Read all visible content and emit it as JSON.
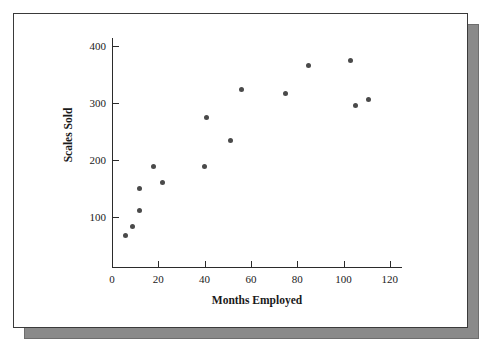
{
  "figure": {
    "background_color": "#ffffff",
    "frame_border_color": "#3a3a3a",
    "shadow_color": "#8a8a8a",
    "point_color": "#4a4a4a",
    "axis_color": "#2b2b2b"
  },
  "chart_data": {
    "type": "scatter",
    "title": "",
    "xlabel": "Months Employed",
    "ylabel": "Scales Sold",
    "xlim": [
      0,
      128
    ],
    "ylim": [
      0,
      420
    ],
    "xticks": [
      0,
      20,
      40,
      60,
      80,
      100,
      120
    ],
    "xtick_labels": [
      "0",
      "20",
      "40",
      "60",
      "80",
      "100",
      "120"
    ],
    "yticks": [
      100,
      200,
      300,
      400
    ],
    "ytick_labels": [
      "100",
      "200",
      "300",
      "400"
    ],
    "grid": false,
    "legend": null,
    "marker": "filled-circle",
    "series": [
      {
        "name": "Salespeople",
        "points": [
          {
            "x": 6,
            "y": 67
          },
          {
            "x": 9,
            "y": 83
          },
          {
            "x": 12,
            "y": 111
          },
          {
            "x": 12,
            "y": 150
          },
          {
            "x": 18,
            "y": 189
          },
          {
            "x": 22,
            "y": 160
          },
          {
            "x": 40,
            "y": 189
          },
          {
            "x": 41,
            "y": 275
          },
          {
            "x": 51,
            "y": 234
          },
          {
            "x": 56,
            "y": 324
          },
          {
            "x": 75,
            "y": 316
          },
          {
            "x": 85,
            "y": 366
          },
          {
            "x": 103,
            "y": 374
          },
          {
            "x": 105,
            "y": 295
          },
          {
            "x": 111,
            "y": 307
          }
        ]
      }
    ]
  }
}
